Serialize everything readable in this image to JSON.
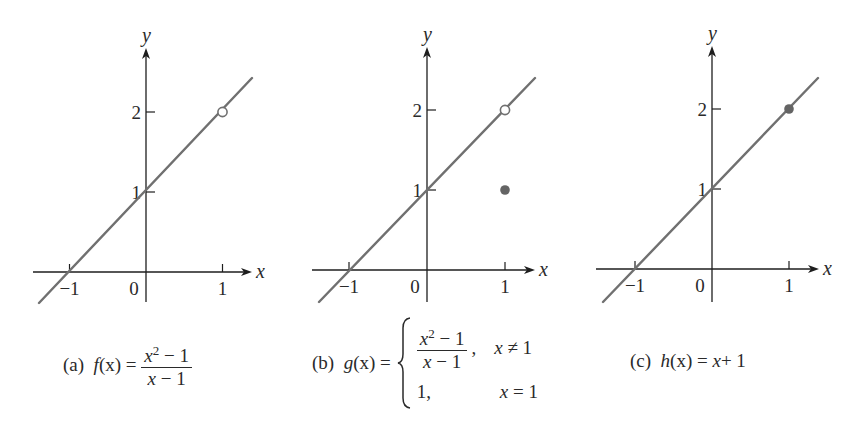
{
  "style": {
    "line_color": "#707070",
    "axis_color": "#1e1e1e",
    "point_color": "#646464"
  },
  "chart_data": [
    {
      "type": "line",
      "panel": "a",
      "title": "(a) f(x) = (x^2 - 1)/(x - 1)",
      "xlabel": "x",
      "ylabel": "y",
      "x_ticks": [
        -1,
        1
      ],
      "y_ticks": [
        1,
        2
      ],
      "origin_label": "0",
      "xlim": [
        -1.5,
        1.35
      ],
      "ylim": [
        -0.4,
        2.9
      ],
      "series": [
        {
          "name": "f(x)",
          "x": [
            -1.4,
            1.4
          ],
          "y": [
            -0.4,
            2.4
          ]
        }
      ],
      "points": [
        {
          "x": 1,
          "y": 2,
          "style": "open"
        }
      ],
      "grid": false,
      "layout": {
        "origin_px": [
          146,
          272
        ],
        "unit_x": 76.5,
        "unit_y": 80,
        "x_axis_px": [
          33,
          252
        ],
        "y_axis_px": [
          48,
          302
        ],
        "line_px": [
          [
            39,
            303
          ],
          [
            252,
            78
          ]
        ]
      }
    },
    {
      "type": "line",
      "panel": "b",
      "title": "(b) g(x) = { (x^2 - 1)/(x - 1), x ≠ 1 ; 1, x = 1 }",
      "xlabel": "x",
      "ylabel": "y",
      "x_ticks": [
        -1,
        1
      ],
      "y_ticks": [
        1,
        2
      ],
      "origin_label": "0",
      "xlim": [
        -1.5,
        1.35
      ],
      "ylim": [
        -0.4,
        2.9
      ],
      "series": [
        {
          "name": "g(x)",
          "x": [
            -1.4,
            1.4
          ],
          "y": [
            -0.4,
            2.4
          ]
        }
      ],
      "points": [
        {
          "x": 1,
          "y": 2,
          "style": "open"
        },
        {
          "x": 1,
          "y": 1,
          "style": "filled"
        }
      ],
      "grid": false,
      "layout": {
        "origin_px": [
          427,
          270
        ],
        "unit_x": 78,
        "unit_y": 80,
        "x_axis_px": [
          312,
          535
        ],
        "y_axis_px": [
          47,
          302
        ],
        "line_px": [
          [
            319,
            302
          ],
          [
            535,
            78
          ]
        ]
      }
    },
    {
      "type": "line",
      "panel": "c",
      "title": "(c) h(x) = x + 1",
      "xlabel": "x",
      "ylabel": "y",
      "x_ticks": [
        -1,
        1
      ],
      "y_ticks": [
        1,
        2
      ],
      "origin_label": "0",
      "xlim": [
        -1.5,
        1.35
      ],
      "ylim": [
        -0.4,
        2.9
      ],
      "series": [
        {
          "name": "h(x)",
          "x": [
            -1.4,
            1.4
          ],
          "y": [
            -0.4,
            2.4
          ]
        }
      ],
      "points": [
        {
          "x": 1,
          "y": 2,
          "style": "filled"
        }
      ],
      "grid": false,
      "layout": {
        "origin_px": [
          712,
          269
        ],
        "unit_x": 77,
        "unit_y": 80,
        "x_axis_px": [
          596,
          819
        ],
        "y_axis_px": [
          46,
          302
        ],
        "line_px": [
          [
            603,
            302
          ],
          [
            818,
            78
          ]
        ]
      }
    }
  ],
  "captions": {
    "a": {
      "label": "(a)",
      "lhs": "f",
      "arg": "(x)",
      "eq": "=",
      "num_var": "x",
      "num_exp": "2",
      "num_rest": " − 1",
      "den_var": "x",
      "den_rest": " − 1"
    },
    "b": {
      "label": "(b)",
      "lhs": "g",
      "arg": "(x)",
      "eq": "=",
      "num_var": "x",
      "num_exp": "2",
      "num_rest": " − 1",
      "den_var": "x",
      "den_rest": " − 1",
      "case1_sep": ",",
      "case1_cond_var": "x",
      "case1_cond_rest": " ≠ 1",
      "case2_val": "1,",
      "case2_cond_var": "x",
      "case2_cond_rest": " = 1"
    },
    "c": {
      "label": "(c)",
      "lhs": "h",
      "arg": "(x)",
      "eq": "=",
      "rhs_var": "x",
      "rhs_rest": " + 1"
    }
  },
  "labels": {
    "neg_one": "−1",
    "one": "1",
    "two": "2",
    "zero": "0",
    "x": "x",
    "y": "y"
  }
}
